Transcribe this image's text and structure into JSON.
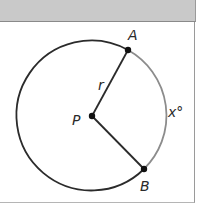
{
  "figure": {
    "type": "circle-with-central-angle",
    "header_color": "#c9c9c9",
    "circle": {
      "center_label": "P",
      "radius_label": "r",
      "stroke_color": "#2b2b2b",
      "arc_color": "#8c8c8c"
    },
    "points": {
      "A": {
        "label": "A"
      },
      "B": {
        "label": "B"
      },
      "P": {
        "label": "P"
      }
    },
    "arc_label": "x°"
  }
}
